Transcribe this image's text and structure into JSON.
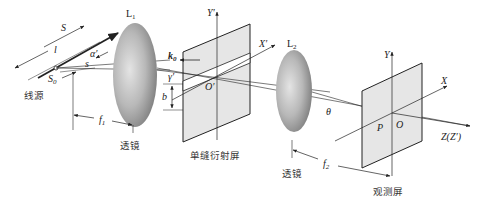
{
  "diagram": {
    "type": "optics-single-slit-fraunhofer-diffraction",
    "labels": {
      "source_line": "S",
      "source_point": "S",
      "source_point_sub": "0",
      "length": "l",
      "alpha": "α′",
      "s": "s",
      "lens1": "L",
      "lens1_sub": "1",
      "lens2": "L",
      "lens2_sub": "2",
      "k0": "k",
      "k0_sub": "0",
      "gamma": "γ′",
      "b": "b",
      "slit_origin": "O′",
      "slit_x_axis": "X′",
      "slit_y_axis": "Y′",
      "theta": "θ",
      "screen_x_axis": "X",
      "screen_y_axis": "Y",
      "screen_origin": "O",
      "point_p": "P",
      "z_axis": "Z(Z′)",
      "f1": "f",
      "f1_sub": "1",
      "f2": "f",
      "f2_sub": "2"
    },
    "captions": {
      "line_source": "线源",
      "lens1": "透镜",
      "slit_screen": "单缝衍射屏",
      "lens2": "透镜",
      "observation_screen": "观测屏"
    },
    "colors": {
      "line": "#222222",
      "screen_fill": "#e6e6e6",
      "lens_light": "#d8d8d8",
      "lens_dark": "#8a8a8a",
      "background": "#ffffff"
    }
  }
}
